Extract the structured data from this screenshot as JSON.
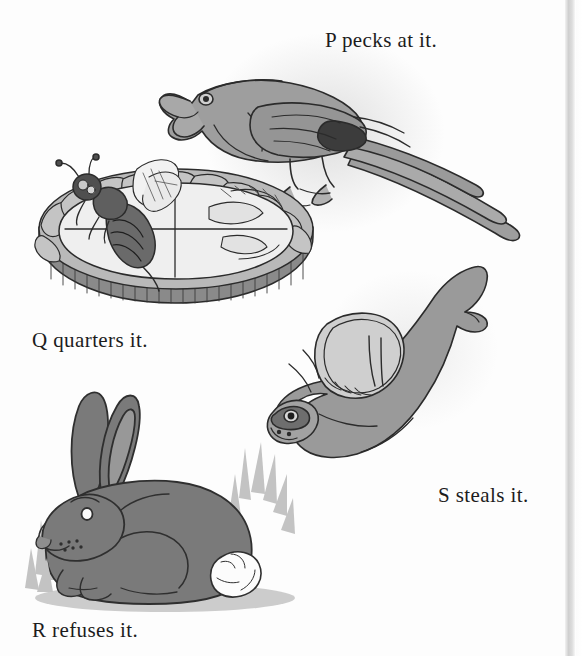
{
  "page": {
    "background_color": "#fdfdfd",
    "width": 582,
    "height": 656,
    "type": "illustrated-alphabet-page"
  },
  "captions": [
    {
      "id": "p",
      "text": "P pecks at it.",
      "x": 325,
      "y": 28
    },
    {
      "id": "q",
      "text": "Q quarters it.",
      "x": 32,
      "y": 328
    },
    {
      "id": "s",
      "text": "S steals it.",
      "x": 438,
      "y": 483
    },
    {
      "id": "r",
      "text": "R refuses it.",
      "x": 32,
      "y": 618
    }
  ],
  "illustrations": [
    {
      "id": "parrot",
      "name": "parrot-illustration",
      "subject": "parrot",
      "caption_id": "p",
      "body_color": "#9e9e9e",
      "shade_color": "#7d7d7d",
      "dark_color": "#3c3c3c",
      "outline_color": "#2b2b2b"
    },
    {
      "id": "pie",
      "name": "pie-with-bee-illustration",
      "subject": "pie with bee",
      "caption_id": "q",
      "crust_color": "#b9b9b9",
      "filling_color": "#ededed",
      "bee_color": "#6a6a6a",
      "outline_color": "#2b2b2b"
    },
    {
      "id": "rabbit",
      "name": "rabbit-illustration",
      "subject": "rabbit",
      "caption_id": "r",
      "body_color": "#7a7a7a",
      "inner_ear_color": "#989898",
      "tail_color": "#fcfcfc",
      "grass_color": "#c3c3c3",
      "outline_color": "#2f2f2f"
    },
    {
      "id": "seal",
      "name": "seal-illustration",
      "subject": "seal",
      "caption_id": "s",
      "body_color": "#9a9a9a",
      "flipper_color": "#cfcfcf",
      "outline_color": "#2b2b2b"
    }
  ],
  "scan": {
    "right_edge_x": 565,
    "edge_color": "#cfcfcf"
  }
}
